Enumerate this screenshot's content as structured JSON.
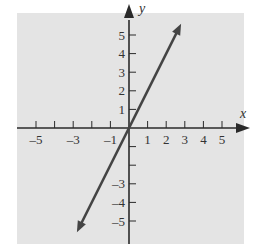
{
  "chart_data": {
    "type": "line",
    "title": "",
    "xlabel": "x",
    "ylabel": "y",
    "xlim": [
      -6,
      6
    ],
    "ylim": [
      -6,
      6
    ],
    "grid": false,
    "x_tick_labels": [
      "-5",
      "-3",
      "-1",
      "1",
      "2",
      "3",
      "4",
      "5"
    ],
    "x_tick_values": [
      -5,
      -3,
      -1,
      1,
      2,
      3,
      4,
      5
    ],
    "y_tick_labels": [
      "5",
      "4",
      "3",
      "2",
      "1",
      "-3",
      "-4",
      "-5"
    ],
    "y_tick_values": [
      5,
      4,
      3,
      2,
      1,
      -3,
      -4,
      -5
    ],
    "series": [
      {
        "name": "y = 2x",
        "equation": "y = 2x",
        "x": [
          -2.8,
          0,
          2.8
        ],
        "y": [
          -5.6,
          0,
          5.6
        ],
        "arrows_both_ends": true
      }
    ],
    "colors": {
      "background": "#e4e4e4",
      "axis": "#2a2a2a",
      "line": "#444444"
    }
  }
}
